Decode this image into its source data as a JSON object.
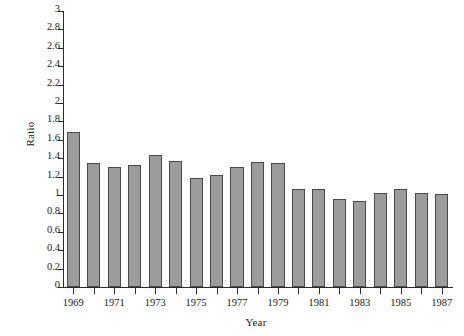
{
  "chart_data": {
    "type": "bar",
    "title": "",
    "xlabel": "Year",
    "ylabel": "Ratio",
    "categories": [
      1969,
      1970,
      1971,
      1972,
      1973,
      1974,
      1975,
      1976,
      1977,
      1978,
      1979,
      1980,
      1981,
      1982,
      1983,
      1984,
      1985,
      1986,
      1987
    ],
    "values": [
      1.68,
      1.35,
      1.3,
      1.33,
      1.44,
      1.37,
      1.18,
      1.22,
      1.3,
      1.36,
      1.35,
      1.07,
      1.06,
      0.96,
      0.93,
      1.02,
      1.07,
      1.02,
      1.01
    ],
    "ylim": [
      0,
      3
    ],
    "ytick_labels": [
      "0",
      "0.2",
      "0.4",
      "0.6",
      "0.8",
      "1",
      "1.2",
      "1.4",
      "1.6",
      "1.8",
      "2",
      "2.2",
      "2.4",
      "2.6",
      "2.8",
      "3"
    ],
    "ytick_values": [
      0,
      0.2,
      0.4,
      0.6,
      0.8,
      1,
      1.2,
      1.4,
      1.6,
      1.8,
      2,
      2.2,
      2.4,
      2.6,
      2.8,
      3
    ],
    "xtick_labels": [
      "1969",
      "",
      "1971",
      "",
      "1973",
      "",
      "1975",
      "",
      "1977",
      "",
      "1979",
      "",
      "1981",
      "",
      "1983",
      "",
      "1985",
      "",
      "1987"
    ],
    "grid": false,
    "legend": false,
    "bar_fill_color": "#9c9c9c",
    "bar_edge_color": "#4a4a4a",
    "axis_color": "#2b2b2b",
    "background_color": "#ffffff"
  }
}
